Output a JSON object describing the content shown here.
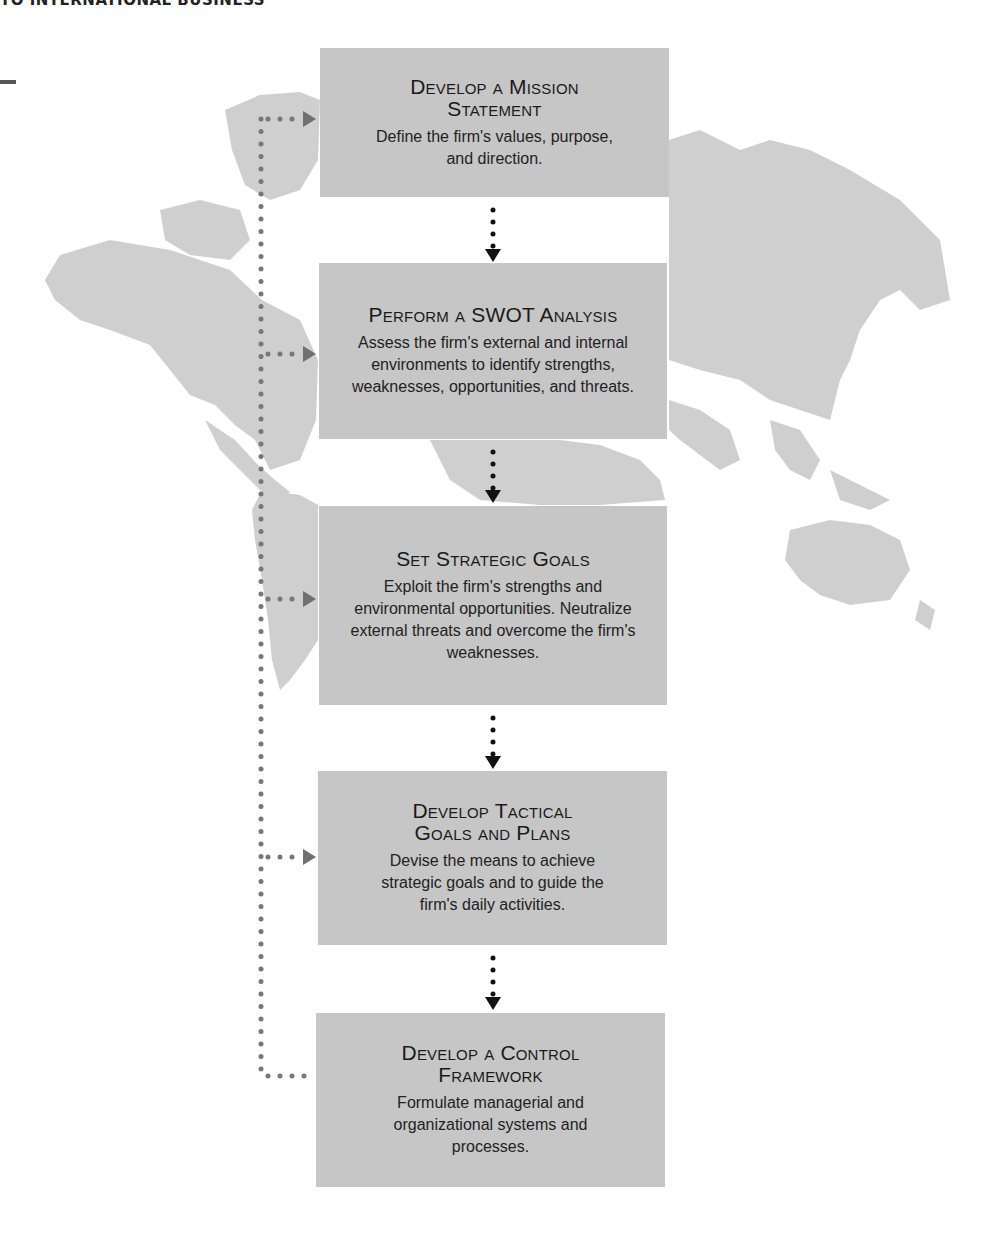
{
  "header": {
    "running_title": "TO INTERNATIONAL BUSINESS"
  },
  "background": {
    "image": "world-map-silhouette",
    "land_color": "#cfcfcf"
  },
  "colors": {
    "box_fill": "#c6c6c6",
    "main_arrow": "#111111",
    "feedback_arrow": "#707070"
  },
  "flow": {
    "steps": [
      {
        "title_line1": "Develop a Mission",
        "title_line2": "Statement",
        "description": "Define the firm's values, purpose, and direction."
      },
      {
        "title_line1": "Perform a SWOT Analysis",
        "title_line2": "",
        "description": "Assess the firm's external and internal environments to identify strengths, weaknesses, opportunities, and threats."
      },
      {
        "title_line1": "Set Strategic Goals",
        "title_line2": "",
        "description": "Exploit the firm's strengths and environmental opportunities. Neutralize external threats and overcome the firm's weaknesses."
      },
      {
        "title_line1": "Develop Tactical",
        "title_line2": "Goals and Plans",
        "description": "Devise the means to achieve strategic goals and to guide the firm's daily activities."
      },
      {
        "title_line1": "Develop a Control",
        "title_line2": "Framework",
        "description": "Formulate managerial and organizational systems and processes."
      }
    ],
    "feedback_loop": "From Control Framework back to each earlier step"
  }
}
